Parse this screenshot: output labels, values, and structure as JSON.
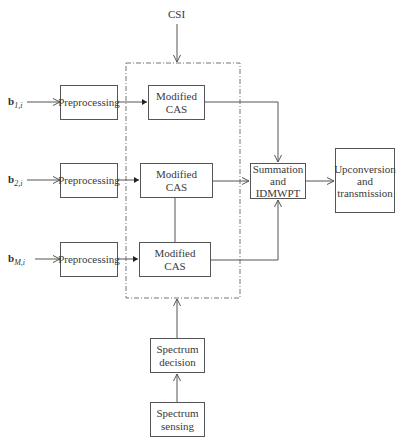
{
  "diagram": {
    "top_input": "CSI",
    "inputs": [
      {
        "symbol": "b",
        "subscript": "1,i"
      },
      {
        "symbol": "b",
        "subscript": "2,i"
      },
      {
        "symbol": "b",
        "subscript": "M,i"
      }
    ],
    "preprocessing": [
      "Preprocessing",
      "Preprocessing",
      "Preprocessing"
    ],
    "cas": [
      {
        "line1": "Modified",
        "line2": "CAS"
      },
      {
        "line1": "Modified",
        "line2": "CAS"
      },
      {
        "line1": "Modified",
        "line2": "CAS"
      }
    ],
    "summation": {
      "line1": "Summation",
      "line2": "and",
      "line3": "IDMWPT"
    },
    "output": {
      "line1": "Upconversion",
      "line2": "and",
      "line3": "transmission"
    },
    "spectrum_decision": {
      "line1": "Spectrum",
      "line2": "decision"
    },
    "spectrum_sensing": {
      "line1": "Spectrum",
      "line2": "sensing"
    }
  },
  "colors": {
    "line": "#555555",
    "dashed": "#777777",
    "text": "#333333"
  }
}
